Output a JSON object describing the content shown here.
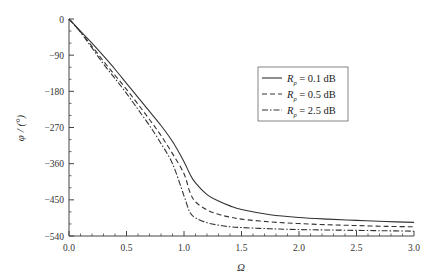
{
  "chart_data": {
    "type": "line",
    "title": "",
    "xlabel": "Ω",
    "ylabel": "φ / (°)",
    "xlim": [
      0.0,
      3.0
    ],
    "ylim": [
      -540,
      0
    ],
    "xticks": [
      "0.0",
      "0.5",
      "1.0",
      "1.5",
      "2.0",
      "2.5",
      "3.0"
    ],
    "yticks": [
      "0",
      "-90",
      "-180",
      "-270",
      "-360",
      "-450",
      "-540"
    ],
    "grid": false,
    "legend_position": "upper right (inside, mid-height)",
    "x": [
      0.0,
      0.1,
      0.2,
      0.3,
      0.4,
      0.5,
      0.6,
      0.7,
      0.8,
      0.9,
      1.0,
      1.05,
      1.1,
      1.2,
      1.3,
      1.4,
      1.5,
      1.75,
      2.0,
      2.25,
      2.5,
      2.75,
      3.0
    ],
    "series": [
      {
        "name": "Rp = 0.1 dB",
        "style": "solid",
        "values": [
          0,
          -30,
          -60,
          -92,
          -125,
          -160,
          -195,
          -230,
          -265,
          -305,
          -355,
          -385,
          -408,
          -437,
          -453,
          -465,
          -474,
          -487,
          -494,
          -498,
          -501,
          -504,
          -506
        ]
      },
      {
        "name": "Rp = 0.5 dB",
        "style": "dashed",
        "values": [
          0,
          -32,
          -68,
          -105,
          -140,
          -175,
          -212,
          -250,
          -290,
          -335,
          -385,
          -430,
          -455,
          -475,
          -486,
          -493,
          -498,
          -505,
          -509,
          -512,
          -514,
          -516,
          -517
        ]
      },
      {
        "name": "Rp = 2.5 dB",
        "style": "dash-dot",
        "values": [
          0,
          -33,
          -72,
          -112,
          -148,
          -185,
          -225,
          -265,
          -310,
          -360,
          -440,
          -480,
          -495,
          -507,
          -513,
          -517,
          -519,
          -522,
          -524,
          -525,
          -526,
          -527,
          -528
        ]
      }
    ]
  },
  "legend": {
    "items": [
      {
        "symbol": "R",
        "sub": "p",
        "text": " = 0.1 dB",
        "style": "solid"
      },
      {
        "symbol": "R",
        "sub": "p",
        "text": " = 0.5 dB",
        "style": "dashed"
      },
      {
        "symbol": "R",
        "sub": "p",
        "text": " = 2.5 dB",
        "style": "dash-dot"
      }
    ]
  },
  "axes": {
    "x_title": "Ω",
    "y_title": "φ / (°)"
  },
  "colors": {
    "line": "#333333",
    "axis": "#444444",
    "legend_border": "#666666"
  }
}
